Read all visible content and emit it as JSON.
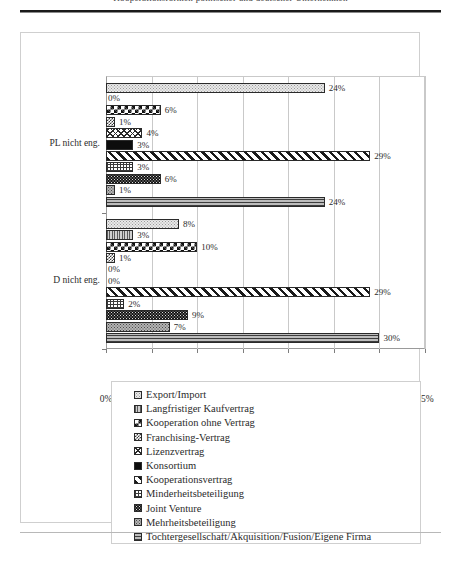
{
  "page": {
    "running_head": "Kooperationsformen polnischer und deutscher Unternehmen"
  },
  "chart_data": {
    "type": "bar",
    "orientation": "horizontal",
    "title": "",
    "xlabel": "",
    "ylabel": "",
    "grid": true,
    "legend_position": "bottom",
    "xlim": [
      0,
      35
    ],
    "xtick_labels": [
      "0%",
      "5%",
      "10%",
      "15%",
      "20%",
      "25%",
      "30%",
      "35%"
    ],
    "xticks": [
      0,
      5,
      10,
      15,
      20,
      25,
      30,
      35
    ],
    "categories": [
      "PL nicht eng.",
      "D nicht eng."
    ],
    "series": [
      {
        "name": "Export/Import",
        "pattern": "p-export",
        "values": [
          24,
          8
        ],
        "labels": [
          "24%",
          "8%"
        ]
      },
      {
        "name": "Langfristiger Kaufvertrag",
        "pattern": "p-langfristig",
        "values": [
          0,
          3
        ],
        "labels": [
          "0%",
          "3%"
        ]
      },
      {
        "name": "Kooperation ohne Vertrag",
        "pattern": "p-koopohne",
        "values": [
          6,
          10
        ],
        "labels": [
          "6%",
          "10%"
        ]
      },
      {
        "name": "Franchising-Vertrag",
        "pattern": "p-franchising",
        "values": [
          1,
          1
        ],
        "labels": [
          "1%",
          "1%"
        ]
      },
      {
        "name": "Lizenzvertrag",
        "pattern": "p-lizenz",
        "values": [
          4,
          0
        ],
        "labels": [
          "4%",
          "0%"
        ]
      },
      {
        "name": "Konsortium",
        "pattern": "p-konsortium",
        "values": [
          3,
          0
        ],
        "labels": [
          "3%",
          "0%"
        ]
      },
      {
        "name": "Kooperationsvertrag",
        "pattern": "p-koopvertrag",
        "values": [
          29,
          29
        ],
        "labels": [
          "29%",
          "29%"
        ]
      },
      {
        "name": "Minderheitsbeteiligung",
        "pattern": "p-minderheits",
        "values": [
          3,
          2
        ],
        "labels": [
          "3%",
          "2%"
        ]
      },
      {
        "name": "Joint Venture",
        "pattern": "p-joint",
        "values": [
          6,
          9
        ],
        "labels": [
          "6%",
          "9%"
        ]
      },
      {
        "name": "Mehrheitsbeteiligung",
        "pattern": "p-mehrheits",
        "values": [
          1,
          7
        ],
        "labels": [
          "1%",
          "7%"
        ]
      },
      {
        "name": "Tochtergesellschaft/Akquisition/Fusion/Eigene Firma",
        "pattern": "p-tochter",
        "values": [
          24,
          30
        ],
        "labels": [
          "24%",
          "30%"
        ]
      }
    ]
  }
}
